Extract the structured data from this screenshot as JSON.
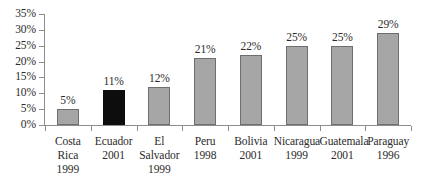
{
  "chart_data": {
    "type": "bar",
    "title": "",
    "subtitle": "",
    "xlabel": "",
    "ylabel": "",
    "categories": [
      "Costa Rica 1999",
      "Ecuador 2001",
      "El Salvador 1999",
      "Peru 1998",
      "Bolivia 2001",
      "Nicaragua 1999",
      "Guatemala 2001",
      "Paraguay 1996"
    ],
    "values": [
      5,
      11,
      12,
      21,
      22,
      25,
      25,
      29
    ],
    "value_labels": [
      "5%",
      "11%",
      "12%",
      "21%",
      "22%",
      "25%",
      "25%",
      "29%"
    ],
    "ylim": [
      0,
      35
    ],
    "ytick_values": [
      0,
      5,
      10,
      15,
      20,
      25,
      30,
      35
    ],
    "ytick_labels": [
      "0%",
      "5%",
      "10%",
      "15%",
      "20%",
      "25%",
      "30%",
      "35%"
    ],
    "grid": false,
    "legend": false,
    "legend_position": "none",
    "units": "percent",
    "bar_colors": [
      "#a6a6a6",
      "#0d0d0d",
      "#a6a6a6",
      "#a6a6a6",
      "#a6a6a6",
      "#a6a6a6",
      "#a6a6a6",
      "#a6a6a6"
    ],
    "bars": [
      {
        "country": "Costa Rica",
        "year": "1999",
        "value": 5,
        "label": "5%",
        "style": "gray",
        "name_lines": [
          "Costa Rica"
        ]
      },
      {
        "country": "Ecuador",
        "year": "2001",
        "value": 11,
        "label": "11%",
        "style": "black",
        "name_lines": [
          "Ecuador"
        ]
      },
      {
        "country": "El Salvador",
        "year": "1999",
        "value": 12,
        "label": "12%",
        "style": "gray",
        "name_lines": [
          "El",
          "Salvador"
        ]
      },
      {
        "country": "Peru",
        "year": "1998",
        "value": 21,
        "label": "21%",
        "style": "gray",
        "name_lines": [
          "Peru"
        ]
      },
      {
        "country": "Bolivia",
        "year": "2001",
        "value": 22,
        "label": "22%",
        "style": "gray",
        "name_lines": [
          "Bolivia"
        ]
      },
      {
        "country": "Nicaragua",
        "year": "1999",
        "value": 25,
        "label": "25%",
        "style": "gray",
        "name_lines": [
          "Nicaragua"
        ]
      },
      {
        "country": "Guatemala",
        "year": "2001",
        "value": 25,
        "label": "25%",
        "style": "gray",
        "name_lines": [
          "Guatemala"
        ]
      },
      {
        "country": "Paraguay",
        "year": "1996",
        "value": 29,
        "label": "29%",
        "style": "gray",
        "name_lines": [
          "Paraguay"
        ]
      }
    ],
    "colors": {
      "axis": "#8d8d8d",
      "text": "#2b2b2b",
      "bar_gray_fill": "#a6a6a6",
      "bar_gray_outline": "#6e6e6e",
      "bar_highlight": "#0d0d0d",
      "background": "#ffffff"
    }
  }
}
